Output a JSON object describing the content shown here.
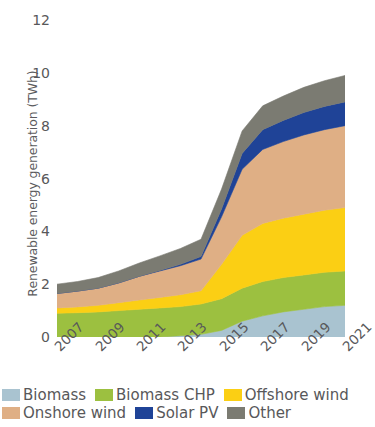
{
  "chart_data": {
    "type": "area",
    "stacked": true,
    "title": "",
    "xlabel": "",
    "ylabel": "Renewable energy generation (TWh)",
    "x": [
      2007,
      2008,
      2009,
      2010,
      2011,
      2012,
      2013,
      2014,
      2015,
      2016,
      2017,
      2018,
      2019,
      2020,
      2021
    ],
    "xticks": [
      "2007",
      "2009",
      "2011",
      "2013",
      "2015",
      "2017",
      "2019",
      "2021"
    ],
    "yticks": [
      "0",
      "2",
      "4",
      "6",
      "8",
      "10",
      "12"
    ],
    "ylim": [
      0,
      12
    ],
    "xlim": [
      2007,
      2021
    ],
    "grid": false,
    "legend_position": "bottom",
    "series": [
      {
        "name": "Biomass",
        "color": "#a9c3d0",
        "values": [
          0.0,
          0.0,
          0.0,
          0.0,
          0.0,
          0.0,
          0.05,
          0.1,
          0.25,
          0.6,
          0.8,
          0.95,
          1.05,
          1.15,
          1.2
        ]
      },
      {
        "name": "Biomass CHP",
        "color": "#9cc040",
        "values": [
          0.9,
          0.92,
          0.95,
          1.0,
          1.05,
          1.1,
          1.1,
          1.15,
          1.2,
          1.25,
          1.3,
          1.3,
          1.3,
          1.3,
          1.3
        ]
      },
      {
        "name": "Offshore wind",
        "color": "#fbcf14",
        "values": [
          0.2,
          0.22,
          0.25,
          0.3,
          0.35,
          0.4,
          0.45,
          0.5,
          1.3,
          2.0,
          2.2,
          2.25,
          2.3,
          2.35,
          2.4
        ]
      },
      {
        "name": "Onshore wind",
        "color": "#dfaf85",
        "values": [
          0.55,
          0.6,
          0.65,
          0.75,
          0.9,
          1.0,
          1.1,
          1.2,
          1.8,
          2.5,
          2.8,
          2.9,
          3.0,
          3.05,
          3.1
        ]
      },
      {
        "name": "Solar PV",
        "color": "#1f4397",
        "values": [
          0.0,
          0.0,
          0.0,
          0.0,
          0.0,
          0.02,
          0.05,
          0.1,
          0.3,
          0.6,
          0.75,
          0.8,
          0.85,
          0.88,
          0.9
        ]
      },
      {
        "name": "Other",
        "color": "#7b7b72",
        "values": [
          0.35,
          0.36,
          0.4,
          0.45,
          0.5,
          0.55,
          0.6,
          0.65,
          0.75,
          0.85,
          0.9,
          0.92,
          0.95,
          0.97,
          1.0
        ]
      }
    ],
    "totals": [
      2.0,
      2.1,
      2.25,
      2.5,
      2.8,
      3.07,
      3.35,
      3.7,
      5.6,
      7.8,
      8.75,
      9.12,
      9.45,
      9.7,
      9.9
    ]
  },
  "axis": {
    "y_title": "Renewable energy generation (TWh)"
  },
  "legend": {
    "rows": [
      [
        {
          "label": "Biomass",
          "color": "#a9c3d0"
        },
        {
          "label": "Biomass CHP",
          "color": "#9cc040"
        },
        {
          "label": "Offshore wind",
          "color": "#fbcf14"
        }
      ],
      [
        {
          "label": "Onshore wind",
          "color": "#dfaf85"
        },
        {
          "label": "Solar PV",
          "color": "#1f4397"
        },
        {
          "label": "Other",
          "color": "#7b7b72"
        }
      ]
    ]
  }
}
